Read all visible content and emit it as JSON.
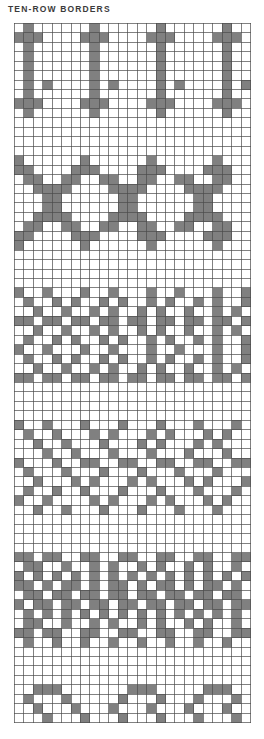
{
  "page": {
    "background_color": "#ffffff",
    "width": 264,
    "height": 739
  },
  "header": {
    "title": "TEN-ROW BORDERS",
    "title_color": "#3b3b3b"
  },
  "chart_data": {
    "type": "heatmap",
    "title": "TEN-ROW BORDERS",
    "xlabel": "",
    "ylabel": "",
    "grid": {
      "columns": 25,
      "rows": 74,
      "cell_size": 9.45,
      "origin_x": 14,
      "origin_y": 22.5,
      "line_color": "#4a4a4a",
      "line_width": 0.7,
      "filled_color": "#808080",
      "empty_color": "#ffffff",
      "legend": {
        "filled": "contrast color stitch",
        "empty": "background color stitch"
      }
    },
    "bands": [
      {
        "name": "band-1-pillars",
        "start_row": 0,
        "row_count": 10,
        "rows": [
          "0100000010000001000000100",
          "1110000111000011100001110",
          "0100000010000001000000100",
          "0100000010000001000000100",
          "0100000010000001000000100",
          "0100000010000001000000100",
          "0101000010100001010000101",
          "0100000010000001000000100",
          "1110000111000011100001110",
          "0100000010000001000000100"
        ]
      },
      {
        "name": "band-2-chain-of-rings",
        "start_row": 14,
        "row_count": 10,
        "rows": [
          "1000000100000010000001000",
          "1100001110000111000011100",
          "0110011001100110011001100",
          "0011110000111100001111000",
          "0001100000011000000110000",
          "0001100000011000000110000",
          "0011110000111100001111000",
          "0110011001100110011001100",
          "1100001110000111000011100",
          "1000000100000010000001000"
        ]
      },
      {
        "name": "band-3-diamond-lattice",
        "start_row": 28,
        "row_count": 10,
        "rows": [
          "1001000100100010010001001",
          "0100101001010010100101001",
          "0010010010100101001001010",
          "1101101101101101101101101",
          "0010010010100101001001010",
          "0100101001010010100101001",
          "1001000100100010010001001",
          "0100101001010010100101001",
          "0010010010100101001001010",
          "1101101101101101101101101"
        ]
      },
      {
        "name": "band-4-scattered-crosses",
        "start_row": 42,
        "row_count": 10,
        "rows": [
          "1001000100010001000100010",
          "0100100010100010100010100",
          "0010010001000101000101000",
          "0001001000100010001000100",
          "1000100110011001100110011",
          "0100010001000100010001000",
          "0010001010001010001010001",
          "0100100100010001000100010",
          "1001000010100010100010100",
          "0010010001000100010001000"
        ]
      },
      {
        "name": "band-5-dense-zigzag",
        "start_row": 56,
        "row_count": 10,
        "rows": [
          "1101100110011001100110011",
          "0110010010100101001010010",
          "1010101010101010101010101",
          "1101011010110101101011010",
          "0110110110110110110110110",
          "1011011011011011011011011",
          "0101010101010101010101010",
          "0110010010100101001010010",
          "1101100110011001100110011",
          "0100100100100100100100100"
        ]
      },
      {
        "name": "band-6-large-motif",
        "start_row": 70,
        "row_count": 10,
        "rows": [
          "0011100000001110000011100",
          "0100010000010001000100010",
          "0010001000100010001000100",
          "0001000100010001000100010",
          "1000100010001000100010001",
          "0100010001000100010001000",
          "1010001000100010001000100",
          "1001000100010001000100010",
          "1000100010001000100010001",
          "0011100011111000111000111"
        ]
      }
    ]
  }
}
